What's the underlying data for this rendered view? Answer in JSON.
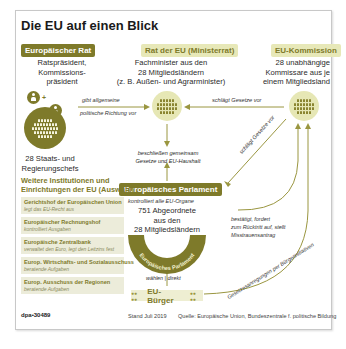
{
  "title": "Die EU auf einen Blick",
  "colors": {
    "olive_dark": "#7e7a2a",
    "olive_light": "#e6e7b5",
    "line": "#9a9640",
    "box_bg": "#ececda"
  },
  "european_council": {
    "header": "Europäischer Rat",
    "members": "Ratspräsident, Kommissions-präsident",
    "members_lines": [
      "Ratspräsident,",
      "Kommissions-",
      "präsident"
    ],
    "heads": "28 Staats- und Regierungschefs",
    "heads_lines": [
      "28 Staats- und",
      "Regierungschefs"
    ],
    "icon": "people-circle-icon"
  },
  "council_of_eu": {
    "header": "Rat der EU (Ministerrat)",
    "desc_lines": [
      "Fachminister aus den",
      "28 Mitgliedsländern",
      "(z. B. Außen- und Agrarminister)"
    ]
  },
  "commission": {
    "header": "EU-Kommission",
    "desc_lines": [
      "28 unabhängige",
      "Kommissare aus je",
      "einem Mitgliedsland"
    ]
  },
  "relations": {
    "council_to_ministers": [
      "gibt allgemeine",
      "politische Richtung vor"
    ],
    "commission_to_ministers": "schlägt Gesetze vor",
    "commission_to_parliament": "schlägt Gesetze vor",
    "joint_decision": [
      "beschließen gemeinsam",
      "Gesetze und EU-Haushalt"
    ],
    "parliament_to_commission": [
      "bestätigt, fordert",
      "zum Rücktritt auf, stellt",
      "Misstrauensantrag"
    ],
    "citizens_vote": [
      "wählen",
      "direkt"
    ],
    "citizens_initiative": "Gesetzesanregungen per Bürgerinitiativen"
  },
  "parliament": {
    "header": "Europäisches Parlament",
    "role": "kontrolliert alle EU-Organe",
    "desc_lines": [
      "751 Abgeordnete",
      "aus den",
      "28 Mitgliedsländern"
    ],
    "arc_label": "Europäisches Parlament"
  },
  "citizens": {
    "label": "EU-Bürger"
  },
  "other_institutions": {
    "title_lines": [
      "Weitere Institutionen und",
      "Einrichtungen der EU (Auswahl)"
    ],
    "items": [
      {
        "name": "Gerichtshof der Europäischen Union",
        "desc": "legt das EU-Recht aus"
      },
      {
        "name": "Europäischer Rechnungshof",
        "desc": "kontrolliert Ausgaben"
      },
      {
        "name": "Europäische Zentralbank",
        "desc": "verwaltet den Euro, legt den Leitzins fest"
      },
      {
        "name": "Europ. Wirtschafts- und Sozialausschuss",
        "desc": "beratende Aufgaben"
      },
      {
        "name": "Europ. Ausschuss der Regionen",
        "desc": "beratende Aufgaben"
      }
    ]
  },
  "footer": {
    "id": "dpa•30489",
    "date": "Stand Juli 2019",
    "source": "Quelle: Europäische Union, Bundeszentrale f. politische Bildung"
  }
}
